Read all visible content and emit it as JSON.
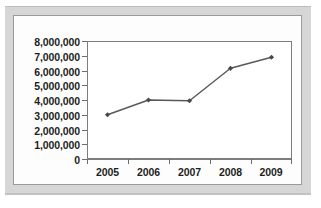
{
  "chart_data": {
    "type": "line",
    "title": "",
    "xlabel": "",
    "ylabel": "",
    "categories": [
      "2005",
      "2006",
      "2007",
      "2008",
      "2009"
    ],
    "series": [
      {
        "name": "series-1",
        "values": [
          3000000,
          4000000,
          3950000,
          6150000,
          6900000
        ]
      }
    ],
    "ylim": [
      0,
      8000000
    ],
    "ytick_labels": [
      "8,000,000",
      "7,000,000",
      "6,000,000",
      "5,000,000",
      "4,000,000",
      "3,000,000",
      "2,000,000",
      "1,000,000",
      "0"
    ],
    "ytick_values": [
      8000000,
      7000000,
      6000000,
      5000000,
      4000000,
      3000000,
      2000000,
      1000000,
      0
    ],
    "xtick_labels": [
      "2005",
      "2006",
      "2007",
      "2008",
      "2009"
    ],
    "grid": false,
    "legend": false,
    "legend_position": "none",
    "marker": "diamond",
    "colors": {
      "line": "#585858",
      "marker": "#4a4a4a",
      "axis": "#7d7d7d",
      "text": "#1d1d1d",
      "plot_background": "#ffffff",
      "panel_background": "#fdfdfd",
      "frame": "#d6d6d6"
    }
  }
}
